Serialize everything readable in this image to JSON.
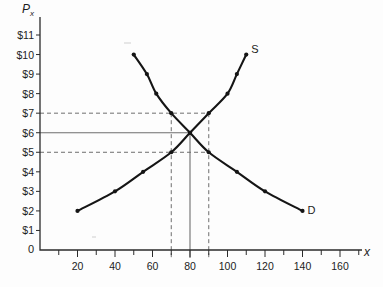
{
  "chart_data": {
    "type": "line",
    "title": "",
    "xlabel": "x",
    "ylabel": "P",
    "ylabel_sub": "x",
    "xlim": [
      0,
      170
    ],
    "ylim": [
      0,
      11.6
    ],
    "grid": false,
    "legend": "inline-curve-labels",
    "x_ticks": [
      20,
      40,
      60,
      80,
      100,
      120,
      140,
      160
    ],
    "x_tick_labels": [
      "20",
      "40",
      "60",
      "80",
      "100",
      "120",
      "140",
      "160"
    ],
    "x_minor_tick_step": 10,
    "y_ticks": [
      1,
      2,
      3,
      4,
      5,
      6,
      7,
      8,
      9,
      10,
      11
    ],
    "y_tick_labels": [
      "$1",
      "$2",
      "$3",
      "$4",
      "$5",
      "$6",
      "$7",
      "$8",
      "$9",
      "$10",
      "$11"
    ],
    "origin_label": "0",
    "series": [
      {
        "name": "S",
        "label": "S",
        "description": "Supply curve, upward sloping",
        "points": [
          {
            "x": 20,
            "y": 2
          },
          {
            "x": 40,
            "y": 3
          },
          {
            "x": 55,
            "y": 4
          },
          {
            "x": 70,
            "y": 5
          },
          {
            "x": 80,
            "y": 6
          },
          {
            "x": 90,
            "y": 7
          },
          {
            "x": 100,
            "y": 8
          },
          {
            "x": 105,
            "y": 9
          },
          {
            "x": 110,
            "y": 10
          }
        ]
      },
      {
        "name": "D",
        "label": "D",
        "description": "Demand curve, downward sloping",
        "points": [
          {
            "x": 50,
            "y": 10
          },
          {
            "x": 57,
            "y": 9
          },
          {
            "x": 62,
            "y": 8
          },
          {
            "x": 70,
            "y": 7
          },
          {
            "x": 80,
            "y": 6
          },
          {
            "x": 90,
            "y": 5
          },
          {
            "x": 105,
            "y": 4
          },
          {
            "x": 120,
            "y": 3
          },
          {
            "x": 140,
            "y": 2
          }
        ]
      }
    ],
    "equilibrium": {
      "x": 80,
      "price": 6
    },
    "reference_lines": [
      {
        "type": "horizontal",
        "value": 7,
        "style": "dashed",
        "from_axis_to_x": 90
      },
      {
        "type": "horizontal",
        "value": 6,
        "style": "solid",
        "from_axis_to_x": 80
      },
      {
        "type": "horizontal",
        "value": 5,
        "style": "dashed",
        "from_axis_to_x": 90
      },
      {
        "type": "vertical",
        "value": 70,
        "style": "dashed",
        "top_price": 7
      },
      {
        "type": "vertical",
        "value": 80,
        "style": "solid",
        "top_price": 6
      },
      {
        "type": "vertical",
        "value": 90,
        "style": "dashed",
        "top_price": 7
      }
    ]
  },
  "curve_labels": {
    "supply": "S",
    "demand": "D"
  },
  "axis_titles": {
    "y": "P",
    "y_sub": "x",
    "x": "x"
  }
}
